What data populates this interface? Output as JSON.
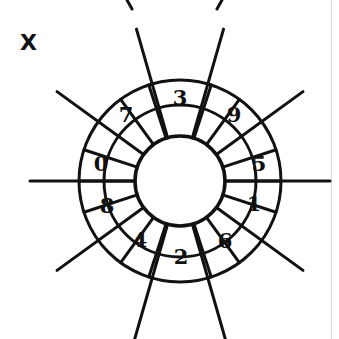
{
  "figure": {
    "label": "X",
    "type": "rosette-wheel-diagram",
    "ink_color": "#111111",
    "background_color": "#ffffff",
    "frame_color": "#d9d9d9"
  },
  "geometry": {
    "center_x": 180,
    "center_y": 181,
    "outer_radius": 101,
    "mid_radius": 76,
    "inner_radius": 45,
    "spoke_outer_extent": 160
  },
  "sectors": [
    {
      "id": "sector-0",
      "label": "0",
      "start_deg": 162,
      "end_deg": 198,
      "label_x": 101,
      "label_y": 163
    },
    {
      "id": "sector-7",
      "label": "7",
      "start_deg": 126,
      "end_deg": 162,
      "label_x": 126,
      "label_y": 114
    },
    {
      "id": "sector-3",
      "label": "3",
      "start_deg": 72,
      "end_deg": 108,
      "label_x": 180,
      "label_y": 97
    },
    {
      "id": "sector-9",
      "label": "9",
      "start_deg": 18,
      "end_deg": 54,
      "label_x": 234,
      "label_y": 114
    },
    {
      "id": "sector-5",
      "label": "5",
      "start_deg": -18,
      "end_deg": 18,
      "label_x": 259,
      "label_y": 163
    },
    {
      "id": "sector-1",
      "label": "1",
      "start_deg": -54,
      "end_deg": -18,
      "label_x": 254,
      "label_y": 203
    },
    {
      "id": "sector-6",
      "label": "6",
      "start_deg": -90,
      "end_deg": -54,
      "label_x": 225,
      "label_y": 240
    },
    {
      "id": "sector-2",
      "label": "2",
      "start_deg": -126,
      "end_deg": -90,
      "label_x": 181,
      "label_y": 256
    },
    {
      "id": "sector-4",
      "label": "4",
      "start_deg": -162,
      "end_deg": -126,
      "label_x": 140,
      "label_y": 239
    },
    {
      "id": "sector-8",
      "label": "8",
      "start_deg": -198,
      "end_deg": -162,
      "label_x": 107,
      "label_y": 205
    }
  ],
  "spokes": [
    {
      "id": "spoke-horizontal-left",
      "angle_deg": 180,
      "inner_r": 45,
      "outer_r": 150
    },
    {
      "id": "spoke-horizontal-right",
      "angle_deg": 0,
      "inner_r": 45,
      "outer_r": 150
    },
    {
      "id": "spoke-upper-left",
      "angle_deg": 144,
      "inner_r": 45,
      "outer_r": 152
    },
    {
      "id": "spoke-upper-right",
      "angle_deg": 36,
      "inner_r": 45,
      "outer_r": 152
    },
    {
      "id": "spoke-top-left",
      "angle_deg": 106,
      "inner_r": 45,
      "outer_r": 158
    },
    {
      "id": "spoke-top-right",
      "angle_deg": 74,
      "inner_r": 45,
      "outer_r": 158
    },
    {
      "id": "spoke-lower-left",
      "angle_deg": -144,
      "inner_r": 45,
      "outer_r": 152
    },
    {
      "id": "spoke-lower-right",
      "angle_deg": -36,
      "inner_r": 45,
      "outer_r": 152
    },
    {
      "id": "spoke-bottom-left",
      "angle_deg": -106,
      "inner_r": 45,
      "outer_r": 165
    },
    {
      "id": "spoke-bottom-right",
      "angle_deg": -74,
      "inner_r": 45,
      "outer_r": 165
    }
  ],
  "divider_rays": [
    {
      "id": "divider-162",
      "angle_deg": 162
    },
    {
      "id": "divider-126",
      "angle_deg": 126
    },
    {
      "id": "divider-108",
      "angle_deg": 108
    },
    {
      "id": "divider-72",
      "angle_deg": 72
    },
    {
      "id": "divider-54",
      "angle_deg": 54
    },
    {
      "id": "divider-18",
      "angle_deg": 18
    },
    {
      "id": "divider--18",
      "angle_deg": -18
    },
    {
      "id": "divider--54",
      "angle_deg": -54
    },
    {
      "id": "divider--72",
      "angle_deg": -72
    },
    {
      "id": "divider--108",
      "angle_deg": -108
    },
    {
      "id": "divider--126",
      "angle_deg": -126
    },
    {
      "id": "divider--162",
      "angle_deg": -162
    },
    {
      "id": "divider-180",
      "angle_deg": 180
    },
    {
      "id": "divider-0",
      "angle_deg": 0
    }
  ],
  "crop_fragments": [
    {
      "id": "fragment-top-left",
      "x1": 127,
      "y1": 0,
      "x2": 132,
      "y2": 9
    },
    {
      "id": "fragment-top-right",
      "x1": 222,
      "y1": 0,
      "x2": 217,
      "y2": 9
    }
  ],
  "label_position": {
    "x": 20,
    "y": 50
  }
}
